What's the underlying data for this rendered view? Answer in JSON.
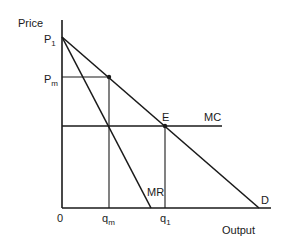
{
  "diagram": {
    "type": "monopoly-pricing",
    "axes": {
      "y_label": "Price",
      "x_label": "Output",
      "origin_label": "0"
    },
    "price_labels": {
      "p1": {
        "main": "P",
        "sub": "1"
      },
      "pm": {
        "main": "P",
        "sub": "m"
      }
    },
    "quantity_labels": {
      "qm": {
        "main": "q",
        "sub": "m"
      },
      "q1": {
        "main": "q",
        "sub": "1"
      }
    },
    "curves": {
      "demand": "D",
      "marginal_revenue": "MR",
      "marginal_cost": "MC"
    },
    "points": {
      "equilibrium": "E"
    },
    "colors": {
      "ink": "#1a1a1a",
      "background": "#ffffff"
    }
  }
}
